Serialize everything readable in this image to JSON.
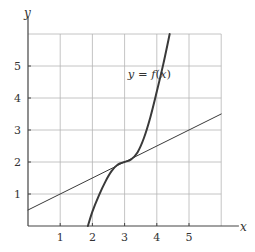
{
  "chart_data": {
    "type": "line",
    "title": "",
    "xlabel": "x",
    "ylabel": "y",
    "xlim": [
      0,
      6
    ],
    "ylim": [
      0,
      6
    ],
    "grid": true,
    "x_ticks": [
      1,
      2,
      3,
      4,
      5
    ],
    "y_ticks": [
      1,
      2,
      3,
      4,
      5
    ],
    "x_tick_labels": [
      "1",
      "2",
      "3",
      "4",
      "5"
    ],
    "y_tick_labels": [
      "1",
      "2",
      "3",
      "4",
      "5"
    ],
    "annotation": {
      "text": "y = f(x)",
      "x": 3.35,
      "y": 4.75
    },
    "series": [
      {
        "name": "y = f(x)",
        "style": "thick",
        "x": [
          1.86,
          2.0,
          2.2,
          2.4,
          2.6,
          2.8,
          3.0,
          3.2,
          3.4,
          3.6,
          3.8,
          4.0,
          4.2,
          4.4
        ],
        "y": [
          0.0,
          0.45,
          0.95,
          1.38,
          1.72,
          1.93,
          2.0,
          2.08,
          2.3,
          2.75,
          3.4,
          4.2,
          5.05,
          6.0
        ]
      },
      {
        "name": "tangent line at x = 3",
        "style": "thin",
        "x": [
          0,
          6
        ],
        "y": [
          0.5,
          3.5
        ]
      }
    ]
  },
  "labels": {
    "x_axis": "x",
    "y_axis": "y",
    "curve_label": "y = f(x)"
  }
}
